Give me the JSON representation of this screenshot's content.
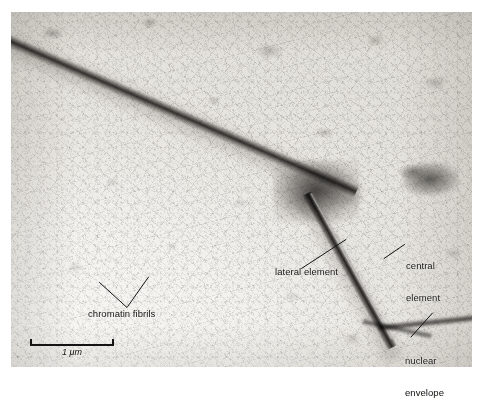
{
  "figure": {
    "kind": "transmission-electron-micrograph",
    "background_color": "#ffffff",
    "plate_color": "#efeeea"
  },
  "annotations": [
    {
      "id": "chromatin-fibrils",
      "text": "chromatin fibrils",
      "leader": "v-shaped-double-leader"
    },
    {
      "id": "lateral-element",
      "text": "lateral element",
      "leader": "diagonal-up-right"
    },
    {
      "id": "central-element",
      "line1": "central",
      "line2": "element",
      "leader": "diagonal-up-right-short"
    },
    {
      "id": "nuclear-envelope",
      "line1": "nuclear",
      "line2": "envelope",
      "leader": "diagonal-up-right"
    }
  ],
  "labels": {
    "chromatin_fibrils": "chromatin fibrils",
    "lateral_element": "lateral element",
    "central_element_line1": "central",
    "central_element_line2": "element",
    "nuclear_envelope_line1": "nuclear",
    "nuclear_envelope_line2": "envelope"
  },
  "scale_bar": {
    "caption": "1 μm",
    "value": 1,
    "unit": "μm",
    "length_px": 84,
    "color": "#141414"
  }
}
